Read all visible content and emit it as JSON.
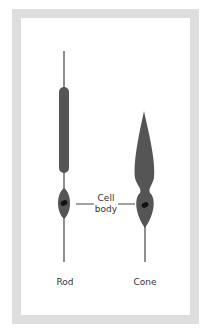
{
  "diagram": {
    "labels": {
      "rod": "Rod",
      "cone": "Cone",
      "cell_body_line1": "Cell",
      "cell_body_line2": "body"
    },
    "colors": {
      "frame": "#dedede",
      "cell_fill": "#555555",
      "nucleus": "#111111",
      "line": "#444444"
    }
  }
}
